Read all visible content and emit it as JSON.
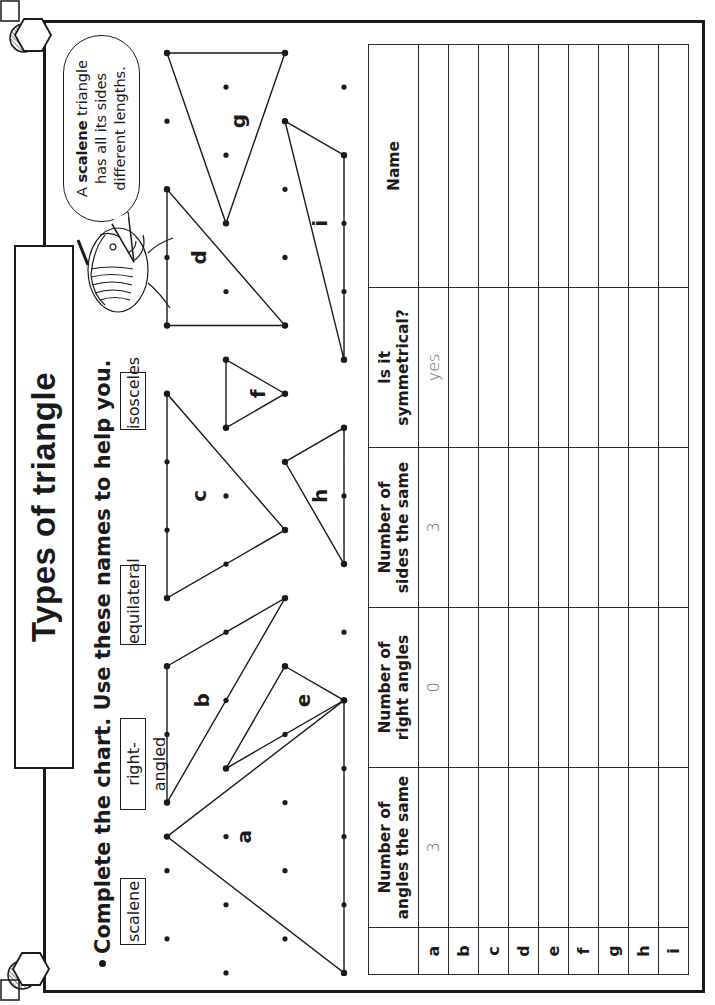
{
  "title": "Types of triangle",
  "instruction": "Complete the chart. Use these names to help you.",
  "word_bank": [
    {
      "label": "scalene"
    },
    {
      "label": "right-angled"
    },
    {
      "label": "equilateral"
    },
    {
      "label": "isosceles"
    }
  ],
  "speech_bubble": {
    "bold_word": "scalene",
    "line1_prefix": "A ",
    "line1_suffix": " triangle",
    "line2": "has all its sides",
    "line3": "different lengths."
  },
  "triangle_labels": [
    "a",
    "b",
    "c",
    "d",
    "e",
    "f",
    "g",
    "h",
    "i"
  ],
  "chart": {
    "headers": {
      "blank": "",
      "angles_line1": "Number of",
      "angles_line2": "angles the same",
      "right_line1": "Number of",
      "right_line2": "right angles",
      "sides_line1": "Number of",
      "sides_line2": "sides the same",
      "sym_line1": "Is it",
      "sym_line2": "symmetrical?",
      "name": "Name"
    },
    "rows": [
      {
        "label": "a",
        "angles_same": "3",
        "right_angles": "0",
        "sides_same": "3",
        "symmetrical": "yes",
        "name": ""
      },
      {
        "label": "b",
        "angles_same": "",
        "right_angles": "",
        "sides_same": "",
        "symmetrical": "",
        "name": ""
      },
      {
        "label": "c",
        "angles_same": "",
        "right_angles": "",
        "sides_same": "",
        "symmetrical": "",
        "name": ""
      },
      {
        "label": "d",
        "angles_same": "",
        "right_angles": "",
        "sides_same": "",
        "symmetrical": "",
        "name": ""
      },
      {
        "label": "e",
        "angles_same": "",
        "right_angles": "",
        "sides_same": "",
        "symmetrical": "",
        "name": ""
      },
      {
        "label": "f",
        "angles_same": "",
        "right_angles": "",
        "sides_same": "",
        "symmetrical": "",
        "name": ""
      },
      {
        "label": "g",
        "angles_same": "",
        "right_angles": "",
        "sides_same": "",
        "symmetrical": "",
        "name": ""
      },
      {
        "label": "h",
        "angles_same": "",
        "right_angles": "",
        "sides_same": "",
        "symmetrical": "",
        "name": ""
      },
      {
        "label": "i",
        "angles_same": "",
        "right_angles": "",
        "sides_same": "",
        "symmetrical": "",
        "name": ""
      }
    ]
  },
  "icons": {
    "corner_decoration": "hexagon-circle-square-icon",
    "character": "girl-head-illustration"
  },
  "colors": {
    "ink": "#1a1a1a",
    "answer_ink": "#666666",
    "paper": "#ffffff"
  }
}
